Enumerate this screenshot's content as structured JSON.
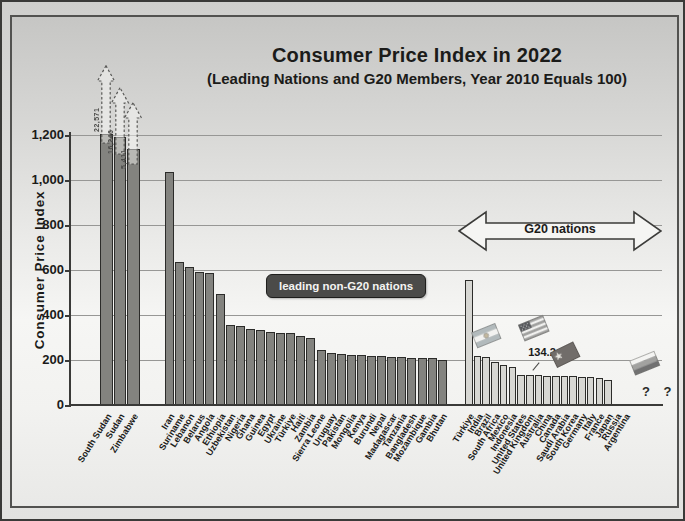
{
  "chart_data": {
    "type": "bar",
    "title": "Consumer Price Index in 2022",
    "subtitle": "(Leading Nations and G20 Members, Year 2010 Equals 100)",
    "ylabel": "Consumer Price Index",
    "ylim": [
      0,
      1200
    ],
    "grid": true,
    "yticks": [
      {
        "value": 0,
        "label": "0"
      },
      {
        "value": 200,
        "label": "200"
      },
      {
        "value": 400,
        "label": "400"
      },
      {
        "value": 600,
        "label": "600"
      },
      {
        "value": 800,
        "label": "800"
      },
      {
        "value": 1000,
        "label": "1,000"
      },
      {
        "value": 1200,
        "label": "1,200"
      }
    ],
    "groups": [
      {
        "id": "off-scale-leaders",
        "off_scale": true,
        "note": "bars exceed the axis; dashed arrows mark off-scale values",
        "categories": [
          "South Sudan",
          "Sudan",
          "Zimbabwe"
        ],
        "values": [
          22571,
          16246,
          5411
        ],
        "value_labels": [
          "22,571",
          "16,246",
          "5,411"
        ],
        "clipped_at_display": [
          1205,
          1190,
          1140
        ]
      },
      {
        "id": "leading-non-g20",
        "label": "leading non-G20 nations",
        "categories": [
          "Iran",
          "Suriname",
          "Lebanon",
          "Belarus",
          "Angola",
          "Ethiopia",
          "Uzbekistan",
          "Nigeria",
          "Ghana",
          "Guinea",
          "Egypt",
          "Ukraine",
          "Türkiye",
          "Haiti",
          "Zambia",
          "Sierra Leone",
          "Uruguay",
          "Pakistan",
          "Mongolia",
          "Kenya",
          "Burundi",
          "Nepal",
          "Madagascar",
          "Tanzania",
          "Bangladesh",
          "Mozambique",
          "Gambia",
          "Bhutan"
        ],
        "values": [
          1035,
          635,
          615,
          590,
          585,
          495,
          355,
          350,
          340,
          332,
          326,
          322,
          318,
          308,
          300,
          243,
          230,
          227,
          224,
          222,
          220,
          218,
          215,
          213,
          211,
          209,
          207,
          198
        ]
      },
      {
        "id": "g20-members",
        "label": "G20 nations",
        "categories": [
          "Türkiye",
          "India",
          "Brazil",
          "South Africa",
          "Mexico",
          "Indonesia",
          "United States",
          "United Kingdom",
          "Australia",
          "China",
          "Canada",
          "Saudi Arabia",
          "South Korea",
          "Germany",
          "Italy",
          "France",
          "Japan",
          "Russia",
          "Argentina"
        ],
        "values": [
          555,
          218,
          214,
          192,
          178,
          170,
          134.2,
          133,
          132,
          131,
          130,
          128,
          127,
          126,
          124,
          121,
          112,
          null,
          null
        ]
      }
    ],
    "annotations": {
      "non_g20_badge": "leading non-G20 nations",
      "g20_arrow": "G20 nations",
      "us_value_label": "134.2",
      "missing_values_label": "? ?"
    },
    "flags_shown": [
      "argentina-flag",
      "united-states-flag",
      "china-flag",
      "russia-flag"
    ],
    "colors": {
      "bar_dark": "#83837f",
      "bar_light": "#d7d7d3",
      "badge_bg": "#4b4b49",
      "grid": "#979795"
    }
  }
}
